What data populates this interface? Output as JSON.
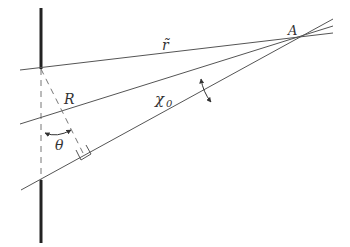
{
  "diagram": {
    "labels": {
      "r_tilde": "r̃",
      "A": "A",
      "R": "R",
      "chi0": "χ",
      "chi0_sub": "0",
      "theta": "θ"
    },
    "colors": {
      "line": "#555555",
      "wall": "#222222",
      "text": "#333333"
    },
    "elements": [
      "thick vertical wall (screen) with gap",
      "three rays converging at point A",
      "dashed perpendicular R from wall top to lower ray",
      "dashed vertical line between wall segments",
      "angle chi0 between middle and lower rays",
      "angle theta between vertical and R",
      "right-angle marker where R meets lower ray"
    ]
  }
}
